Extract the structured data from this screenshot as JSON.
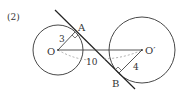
{
  "problem_number": "(2)",
  "points": {
    "O": "O",
    "O_prime": "O′",
    "A": "A",
    "B": "B"
  },
  "lengths": {
    "OA": "3",
    "OO_prime": "10",
    "O_prime_B": "4"
  },
  "colors": {
    "stroke": "#333333",
    "dashed": "#999999",
    "background": "#ffffff"
  }
}
